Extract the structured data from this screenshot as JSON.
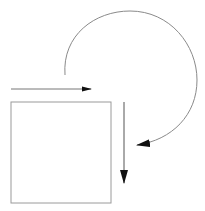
{
  "diagram": {
    "colors": {
      "background": "#ffffff",
      "stroke_light": "#9a9a9a",
      "stroke_dark": "#555555",
      "arrowhead": "#111111"
    },
    "square": {
      "x": 11,
      "y": 102,
      "width": 100,
      "height": 101
    },
    "horizontal_arrow": {
      "x1": 11,
      "y1": 89,
      "x2": 91,
      "y2": 89,
      "direction": "right"
    },
    "vertical_arrow": {
      "x1": 124,
      "y1": 102,
      "x2": 124,
      "y2": 183,
      "direction": "down"
    },
    "curved_arrow": {
      "start": [
        65,
        75
      ],
      "end": [
        137,
        145
      ],
      "rotation": "clockwise",
      "top_y": 11,
      "right_x": 197
    }
  }
}
